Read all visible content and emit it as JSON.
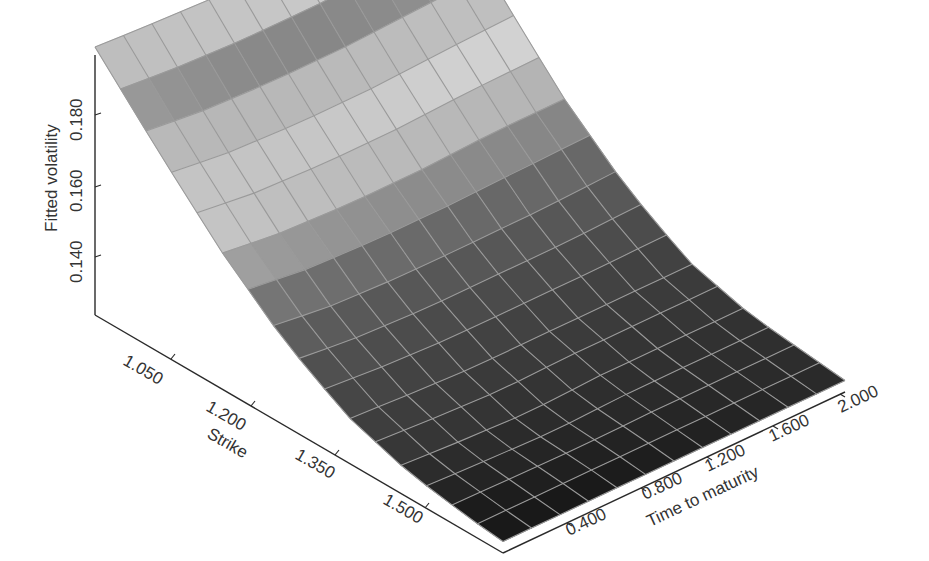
{
  "chart_data": {
    "type": "surface",
    "title": "",
    "xlabel": "Strike",
    "ylabel": "Time to maturity",
    "zlabel": "Fitted volatility",
    "x_ticks": [
      "1.050",
      "1.200",
      "1.350",
      "1.500"
    ],
    "y_ticks": [
      "0.400",
      "0.800",
      "1.200",
      "1.600",
      "2.000"
    ],
    "z_ticks": [
      "0.140",
      "0.160",
      "0.180"
    ],
    "x_range": [
      0.95,
      1.6
    ],
    "y_range": [
      0.1,
      2.0
    ],
    "z_range": [
      0.123,
      0.197
    ],
    "grid": true,
    "legend": "none",
    "strike": [
      0.95,
      1.05,
      1.15,
      1.25,
      1.35,
      1.45,
      1.55,
      1.6
    ],
    "time": [
      0.1,
      0.4,
      0.8,
      1.2,
      1.6,
      2.0
    ],
    "fitted_volatility": [
      [
        0.197,
        0.196,
        0.195,
        0.195,
        0.196,
        0.197
      ],
      [
        0.178,
        0.176,
        0.175,
        0.175,
        0.176,
        0.177
      ],
      [
        0.16,
        0.158,
        0.157,
        0.157,
        0.158,
        0.158
      ],
      [
        0.145,
        0.143,
        0.142,
        0.142,
        0.142,
        0.143
      ],
      [
        0.134,
        0.133,
        0.132,
        0.132,
        0.132,
        0.132
      ],
      [
        0.128,
        0.127,
        0.126,
        0.127,
        0.127,
        0.127
      ],
      [
        0.125,
        0.125,
        0.125,
        0.125,
        0.125,
        0.125
      ],
      [
        0.124,
        0.124,
        0.124,
        0.124,
        0.124,
        0.124
      ]
    ]
  },
  "axes": {
    "z": {
      "label": "Fitted volatility",
      "ticks": [
        {
          "label": "0.140",
          "value": 0.14
        },
        {
          "label": "0.160",
          "value": 0.16
        },
        {
          "label": "0.180",
          "value": 0.18
        }
      ]
    },
    "strike": {
      "label": "Strike",
      "ticks": [
        {
          "label": "1.050",
          "value": 1.05
        },
        {
          "label": "1.200",
          "value": 1.2
        },
        {
          "label": "1.350",
          "value": 1.35
        },
        {
          "label": "1.500",
          "value": 1.5
        }
      ]
    },
    "time": {
      "label": "Time to maturity",
      "ticks": [
        {
          "label": "0.400",
          "value": 0.4
        },
        {
          "label": "0.800",
          "value": 0.8
        },
        {
          "label": "1.200",
          "value": 1.2
        },
        {
          "label": "1.600",
          "value": 1.6
        },
        {
          "label": "2.000",
          "value": 2.0
        }
      ]
    }
  },
  "colors": {
    "axis": "#2a2a2a",
    "grid": "#9a9a9a",
    "surface_light": "#f2f2f2",
    "surface_dark": "#1e1e1e",
    "background": "#ffffff"
  }
}
